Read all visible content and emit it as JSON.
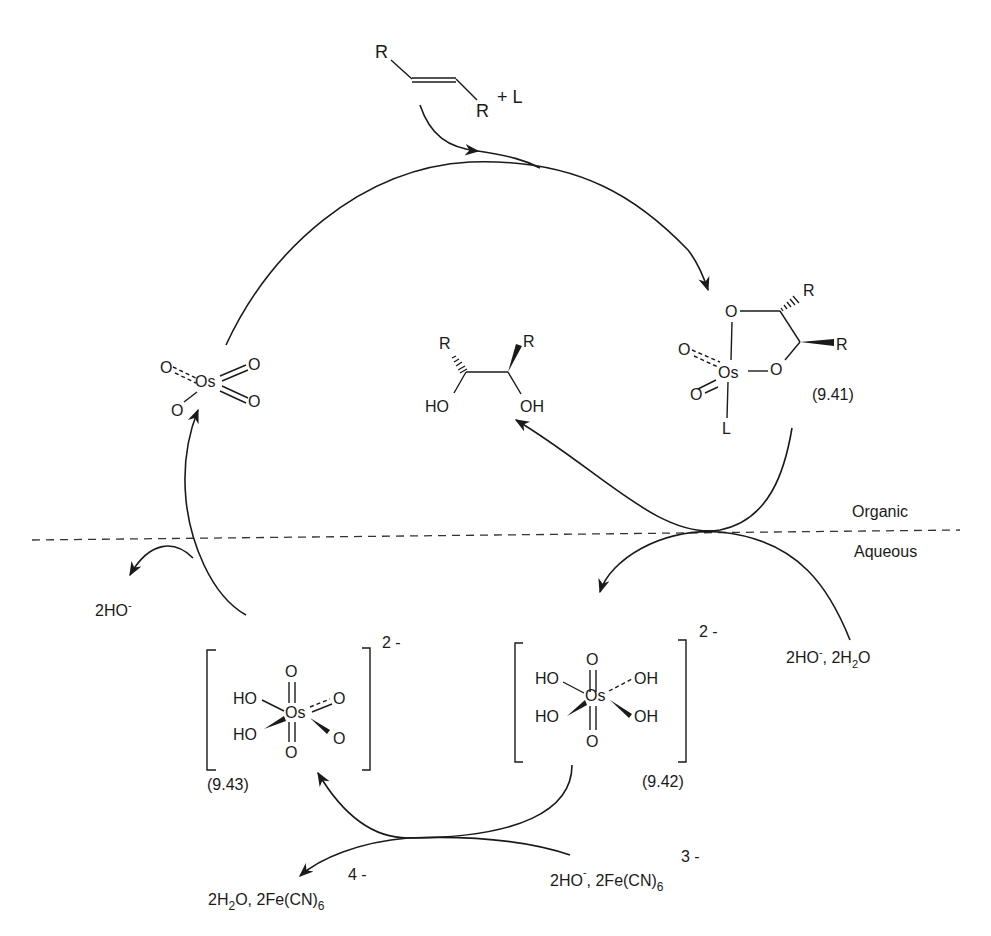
{
  "diagram": {
    "type": "catalytic cycle",
    "phase_labels": {
      "organic": "Organic",
      "aqueous": "Aqueous"
    },
    "reactants_top": {
      "alkene_R1": "R",
      "alkene_R2": "R",
      "plus_ligand": "+ L"
    },
    "osmate_ester": {
      "R_top": "R",
      "R_side": "R",
      "O_ring_top": "O",
      "O_ring_right": "O",
      "O_oxo_1": "O",
      "O_oxo_2": "O",
      "Os": "Os",
      "L": "L",
      "label": "(9.41)"
    },
    "osmium_tetroxide": {
      "O1": "O",
      "O2": "O",
      "O3": "O",
      "O4": "O",
      "Os": "Os"
    },
    "diol_product": {
      "R_left": "R",
      "R_right": "R",
      "HO_left": "HO",
      "OH_right": "OH"
    },
    "aq_inputs_right": {
      "text": "2HO",
      "sup": "-",
      "rest": ", 2H",
      "sub": "2",
      "end": "O"
    },
    "hydroxide_released": {
      "text": "2HO",
      "sup": "-"
    },
    "species_942": {
      "charge": "2 -",
      "O_top": "O",
      "O_bottom": "O",
      "Os": "Os",
      "HO_tl": "HO",
      "HO_bl": "HO",
      "OH_tr": "OH",
      "OH_br": "OH",
      "label": "(9.42)"
    },
    "species_943": {
      "charge": "2 -",
      "O_top": "O",
      "O_bottom": "O",
      "Os": "Os",
      "HO_tl": "HO",
      "HO_bl": "HO",
      "O_tr": "O",
      "O_br": "O",
      "label": "(9.43)"
    },
    "oxidant_in": {
      "pre": "2HO",
      "sup1": "-",
      "mid": ", 2Fe(CN)",
      "sub": "6",
      "charge": "3 -"
    },
    "oxidant_out": {
      "pre": "2H",
      "sub1": "2",
      "mid": "O, 2Fe(CN)",
      "sub2": "6",
      "charge": "4 -"
    }
  }
}
